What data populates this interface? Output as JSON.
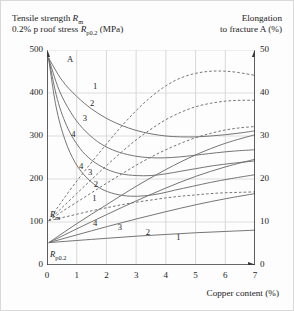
{
  "header": {
    "left_line1_pre": "Tensile strength ",
    "left_line1_sym": "R",
    "left_line1_sub": "m",
    "left_line2_pre": "0.2% p roof stress ",
    "left_line2_sym": "R",
    "left_line2_sub": "p0.2",
    "left_line2_post": " (MPa)",
    "right_line1": "Elongation",
    "right_line2": "to fracture A (%)"
  },
  "annotations": {
    "peak_marker": "A",
    "rm_sym": "R",
    "rm_sub": "m",
    "rp_sym": "R",
    "rp_sub": "p0.2"
  },
  "chart_data": {
    "type": "line",
    "title": "",
    "xlabel": "Copper content (%)",
    "ylabel": "Tensile strength Rm / 0.2% p roof stress Rp0.2 (MPa)",
    "y2label": "Elongation to fracture A (%)",
    "xlim": [
      0,
      7
    ],
    "ylim": [
      0,
      500
    ],
    "y2lim": [
      0,
      50
    ],
    "xticks": [
      "0",
      "1",
      "2",
      "3",
      "4",
      "5",
      "6",
      "7"
    ],
    "yticks": [
      "0",
      "100",
      "200",
      "300",
      "400",
      "500"
    ],
    "y2ticks": [
      "0",
      "10",
      "20",
      "30",
      "40",
      "50"
    ],
    "grid": "vertical-and-horizontal",
    "legend": "inline-curve-numbers",
    "series": [
      {
        "name": "A-1",
        "style": "solid",
        "axis": "right",
        "label": "1",
        "label_xy": [
          1.55,
          415
        ],
        "points": [
          [
            0.05,
            482
          ],
          [
            0.5,
            430
          ],
          [
            1.0,
            392
          ],
          [
            1.5,
            363
          ],
          [
            2.0,
            341
          ],
          [
            2.5,
            325
          ],
          [
            3.0,
            313
          ],
          [
            3.5,
            305
          ],
          [
            4.0,
            300
          ],
          [
            4.5,
            298
          ],
          [
            5.0,
            298
          ],
          [
            5.5,
            300
          ],
          [
            6.0,
            303
          ],
          [
            6.5,
            307
          ],
          [
            7.0,
            312
          ]
        ]
      },
      {
        "name": "A-2",
        "style": "solid",
        "axis": "right",
        "label": "2",
        "label_xy": [
          1.45,
          375
        ],
        "points": [
          [
            0.05,
            482
          ],
          [
            0.4,
            408
          ],
          [
            0.8,
            355
          ],
          [
            1.2,
            318
          ],
          [
            1.7,
            287
          ],
          [
            2.2,
            268
          ],
          [
            2.7,
            257
          ],
          [
            3.2,
            251
          ],
          [
            3.7,
            249
          ],
          [
            4.2,
            250
          ],
          [
            4.7,
            253
          ],
          [
            5.2,
            257
          ],
          [
            5.7,
            261
          ],
          [
            6.3,
            265
          ],
          [
            7.0,
            268
          ]
        ]
      },
      {
        "name": "A-3",
        "style": "solid",
        "axis": "right",
        "label": "3",
        "label_xy": [
          1.2,
          340
        ],
        "points": [
          [
            0.05,
            482
          ],
          [
            0.35,
            385
          ],
          [
            0.7,
            318
          ],
          [
            1.1,
            272
          ],
          [
            1.5,
            244
          ],
          [
            2.0,
            223
          ],
          [
            2.5,
            212
          ],
          [
            3.0,
            208
          ],
          [
            3.5,
            208
          ],
          [
            4.0,
            212
          ],
          [
            4.5,
            218
          ],
          [
            5.0,
            224
          ],
          [
            5.6,
            231
          ],
          [
            6.3,
            237
          ],
          [
            7.0,
            242
          ]
        ]
      },
      {
        "name": "A-4",
        "style": "solid",
        "axis": "right",
        "label": "4",
        "label_xy": [
          0.82,
          303
        ],
        "points": [
          [
            0.05,
            482
          ],
          [
            0.3,
            370
          ],
          [
            0.6,
            292
          ],
          [
            0.95,
            238
          ],
          [
            1.35,
            202
          ],
          [
            1.8,
            178
          ],
          [
            2.3,
            165
          ],
          [
            2.8,
            160
          ],
          [
            3.3,
            161
          ],
          [
            3.8,
            166
          ],
          [
            4.3,
            174
          ],
          [
            4.9,
            183
          ],
          [
            5.5,
            192
          ],
          [
            6.2,
            201
          ],
          [
            7.0,
            210
          ]
        ]
      },
      {
        "name": "Rm-1",
        "style": "dashed",
        "axis": "left",
        "label": "1",
        "label_xy": [
          1.52,
          153
        ],
        "points": [
          [
            0.06,
            103
          ],
          [
            0.5,
            110
          ],
          [
            1.0,
            118
          ],
          [
            1.5,
            126
          ],
          [
            2.0,
            133
          ],
          [
            2.5,
            140
          ],
          [
            3.0,
            146
          ],
          [
            3.5,
            151
          ],
          [
            4.0,
            156
          ],
          [
            4.5,
            160
          ],
          [
            5.0,
            163
          ],
          [
            5.5,
            166
          ],
          [
            6.0,
            168
          ],
          [
            6.5,
            169
          ],
          [
            7.0,
            170
          ]
        ]
      },
      {
        "name": "Rm-2",
        "style": "dashed",
        "axis": "left",
        "label": "2",
        "label_xy": [
          1.57,
          186
        ],
        "points": [
          [
            0.06,
            103
          ],
          [
            0.5,
            124
          ],
          [
            1.0,
            146
          ],
          [
            1.5,
            168
          ],
          [
            2.0,
            190
          ],
          [
            2.5,
            211
          ],
          [
            3.0,
            232
          ],
          [
            3.5,
            251
          ],
          [
            4.0,
            268
          ],
          [
            4.5,
            283
          ],
          [
            5.0,
            296
          ],
          [
            5.5,
            306
          ],
          [
            6.0,
            314
          ],
          [
            6.5,
            319
          ],
          [
            7.0,
            322
          ]
        ]
      },
      {
        "name": "Rm-3",
        "style": "dashed",
        "axis": "left",
        "label": "3",
        "label_xy": [
          1.38,
          215
        ],
        "points": [
          [
            0.06,
            103
          ],
          [
            0.5,
            133
          ],
          [
            1.0,
            166
          ],
          [
            1.5,
            199
          ],
          [
            2.0,
            231
          ],
          [
            2.5,
            262
          ],
          [
            3.0,
            291
          ],
          [
            3.5,
            316
          ],
          [
            4.0,
            338
          ],
          [
            4.5,
            355
          ],
          [
            5.0,
            368
          ],
          [
            5.5,
            376
          ],
          [
            6.0,
            381
          ],
          [
            6.5,
            383
          ],
          [
            7.0,
            383
          ]
        ]
      },
      {
        "name": "Rm-4",
        "style": "dashed",
        "axis": "left",
        "label": "4",
        "label_xy": [
          1.08,
          228
        ],
        "points": [
          [
            0.06,
            103
          ],
          [
            0.45,
            143
          ],
          [
            0.9,
            186
          ],
          [
            1.4,
            230
          ],
          [
            1.9,
            273
          ],
          [
            2.4,
            314
          ],
          [
            2.9,
            352
          ],
          [
            3.4,
            385
          ],
          [
            3.9,
            412
          ],
          [
            4.4,
            432
          ],
          [
            4.9,
            444
          ],
          [
            5.4,
            450
          ],
          [
            5.9,
            451
          ],
          [
            6.4,
            448
          ],
          [
            7.0,
            441
          ]
        ]
      },
      {
        "name": "Rp02-1",
        "style": "solid",
        "axis": "left",
        "label": "1",
        "label_xy": [
          4.35,
          63
        ],
        "points": [
          [
            0.06,
            52
          ],
          [
            1.0,
            57
          ],
          [
            2.0,
            62
          ],
          [
            3.0,
            67
          ],
          [
            4.0,
            71
          ],
          [
            5.0,
            75
          ],
          [
            6.0,
            78
          ],
          [
            7.0,
            81
          ]
        ]
      },
      {
        "name": "Rp02-2",
        "style": "solid",
        "axis": "left",
        "label": "2",
        "label_xy": [
          3.32,
          75
        ],
        "points": [
          [
            0.06,
            52
          ],
          [
            1.0,
            70
          ],
          [
            2.0,
            89
          ],
          [
            3.0,
            107
          ],
          [
            4.0,
            124
          ],
          [
            5.0,
            140
          ],
          [
            6.0,
            154
          ],
          [
            7.0,
            166
          ]
        ]
      },
      {
        "name": "Rp02-3",
        "style": "solid",
        "axis": "left",
        "label": "3",
        "label_xy": [
          2.38,
          86
        ],
        "points": [
          [
            0.06,
            52
          ],
          [
            1.0,
            84
          ],
          [
            2.0,
            117
          ],
          [
            3.0,
            149
          ],
          [
            4.0,
            179
          ],
          [
            5.0,
            206
          ],
          [
            6.0,
            228
          ],
          [
            7.0,
            246
          ]
        ]
      },
      {
        "name": "Rp02-4",
        "style": "solid",
        "axis": "left",
        "label": "4",
        "label_xy": [
          1.55,
          96
        ],
        "points": [
          [
            0.06,
            52
          ],
          [
            1.0,
            96
          ],
          [
            2.0,
            140
          ],
          [
            3.0,
            183
          ],
          [
            4.0,
            222
          ],
          [
            5.0,
            256
          ],
          [
            6.0,
            283
          ],
          [
            7.0,
            303
          ]
        ]
      }
    ]
  }
}
